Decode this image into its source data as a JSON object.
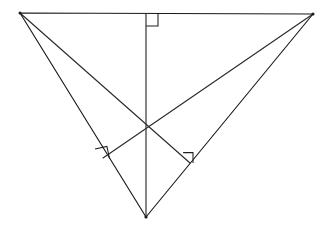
{
  "figure": {
    "type": "geometry-diagram",
    "background_color": "#ffffff",
    "stroke_color": "#1a1a1a",
    "canvas": {
      "width": 330,
      "height": 233
    }
  },
  "geometry": {
    "vertices": {
      "top_left": {
        "label": "A",
        "x": 20,
        "y": 13
      },
      "top_right": {
        "label": "B",
        "x": 313,
        "y": 14
      },
      "bottom": {
        "label": "C",
        "x": 146,
        "y": 217
      }
    },
    "orthocenter": {
      "label": "H",
      "x": 146,
      "y": 122
    },
    "altitude_feet": {
      "from_bottom_to_top_side": {
        "label": "F1",
        "x": 146,
        "y": 14
      },
      "from_top_right_to_left_side": {
        "label": "F2",
        "x": 103,
        "y": 158
      },
      "from_top_left_to_right_side": {
        "label": "F3",
        "x": 190,
        "y": 163
      }
    },
    "sides": [
      {
        "name": "top-side",
        "from": "top_left",
        "to": "top_right"
      },
      {
        "name": "left-side",
        "from": "top_left",
        "to": "bottom"
      },
      {
        "name": "right-side",
        "from": "top_right",
        "to": "bottom"
      }
    ],
    "altitudes": [
      {
        "name": "altitude-from-bottom-vertex",
        "from": "bottom",
        "to_foot": "from_bottom_to_top_side"
      },
      {
        "name": "altitude-from-top-right-vertex",
        "from": "top_right",
        "to_foot": "from_top_right_to_left_side"
      },
      {
        "name": "altitude-from-top-left-vertex",
        "from": "top_left",
        "to_foot": "from_top_left_to_right_side"
      }
    ],
    "right_angle_marks": [
      {
        "name": "right-angle-top",
        "at_foot": "from_bottom_to_top_side",
        "size": 12,
        "points": "146,26 158,26 158,14"
      },
      {
        "name": "right-angle-lower-left",
        "at_foot": "from_top_right_to_left_side",
        "size": 12,
        "points": "95.0,149.0 106.9,146.4 109.5,158.3"
      },
      {
        "name": "right-angle-lower-right",
        "at_foot": "from_top_left_to_right_side",
        "size": 12,
        "points": "183.1,152.6 193.0,152.6 193.0,163.0"
      }
    ]
  },
  "paths": {
    "triangle_outline": "M 20,13 L 313,14 L 146,217 Z",
    "altitude_vertical": "M 146,217 L 146,14",
    "altitude_from_top_right": "M 313,14 L 103,158",
    "altitude_from_top_left": "M 20,13 L 190,163"
  }
}
